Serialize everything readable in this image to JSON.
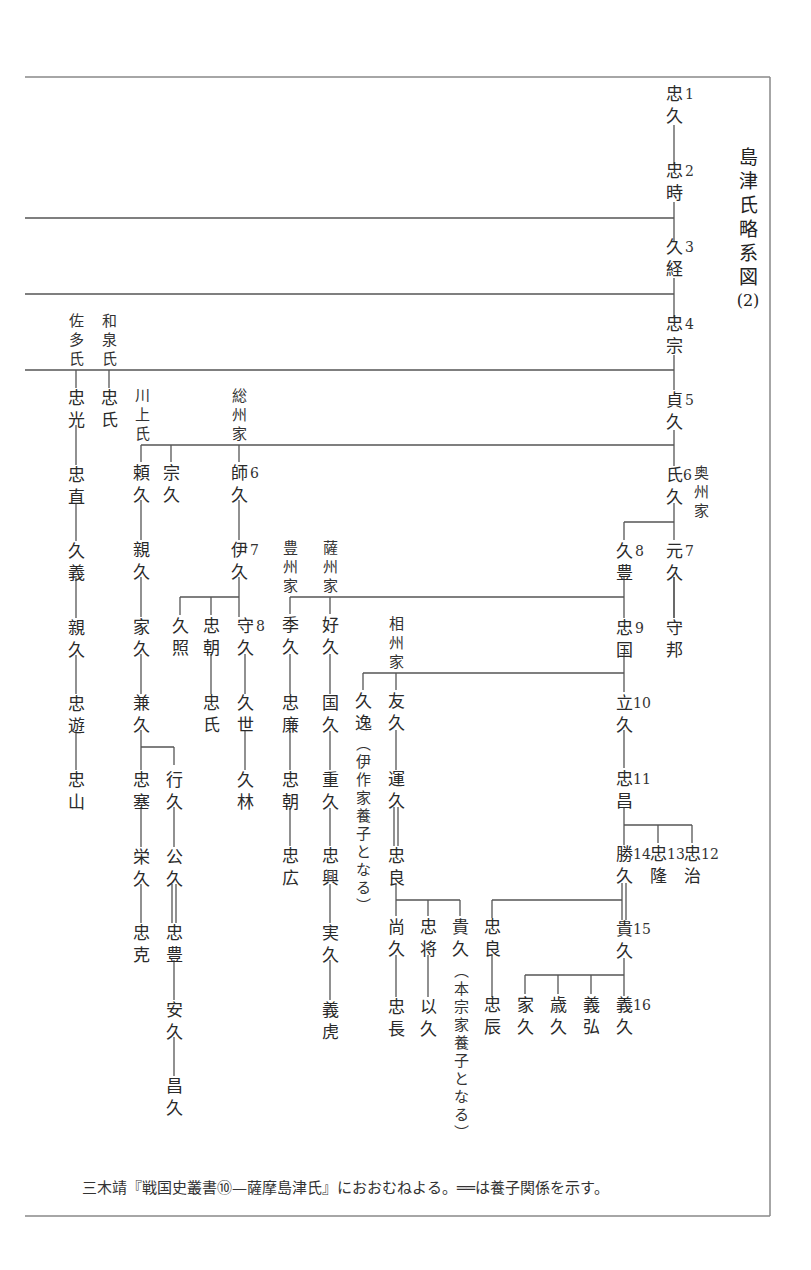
{
  "title_chars": [
    "島",
    "津",
    "氏",
    "略",
    "系",
    "図",
    "(2)"
  ],
  "caption": "三木靖『戦国史叢書⑩—薩摩島津氏』におおむねよる。══は養子関係を示す。",
  "branch_labels": {
    "sata": "佐多氏",
    "izumi": "和泉氏",
    "kawakami": "川上氏",
    "soshu": "総州家",
    "oshu": "奥州家",
    "hoshu": "豊州家",
    "sasshu": "薩州家",
    "soshu_sagami": "相州家"
  },
  "notes": {
    "hisayasu": "（伊作家養子となる）",
    "takahisa": "（本宗家養子となる）"
  },
  "main_line": [
    {
      "name": "忠久",
      "num": "1"
    },
    {
      "name": "忠時",
      "num": "2"
    },
    {
      "name": "久経",
      "num": "3"
    },
    {
      "name": "忠宗",
      "num": "4"
    },
    {
      "name": "貞久",
      "num": "5"
    },
    {
      "name": "氏久",
      "num": "6"
    },
    {
      "name": "元久",
      "num": "7"
    },
    {
      "name": "久豊",
      "num": "8"
    },
    {
      "name": "忠国",
      "num": "9"
    },
    {
      "name": "立久",
      "num": "10"
    },
    {
      "name": "忠昌",
      "num": "11"
    },
    {
      "name": "忠治",
      "num": "12"
    },
    {
      "name": "忠隆",
      "num": "13"
    },
    {
      "name": "勝久",
      "num": "14"
    },
    {
      "name": "貴久",
      "num": "15"
    },
    {
      "name": "義久",
      "num": "16"
    }
  ],
  "sata_line": [
    "忠光",
    "忠直",
    "久義",
    "親久",
    "忠遊",
    "忠山"
  ],
  "izumi_line": [
    "忠氏"
  ],
  "kawakami_line": [
    "頼久",
    "親久",
    "家久",
    "兼久",
    "忠塞",
    "栄久",
    "忠克"
  ],
  "kawakami_branch": [
    "行久",
    "公久",
    "忠豊",
    "安久",
    "昌久"
  ],
  "muneshisa": "宗久",
  "soshu_line": [
    {
      "name": "師久",
      "num": "6"
    },
    {
      "name": "伊久",
      "num": "7"
    },
    {
      "name": "守久",
      "num": "8"
    },
    {
      "name": "久世"
    },
    {
      "name": "久林"
    }
  ],
  "soshu_others": [
    "久照",
    "忠朝",
    "忠氏"
  ],
  "hoshu_line": [
    "季久",
    "忠廉",
    "忠朝",
    "忠広"
  ],
  "sasshu_line": [
    "好久",
    "国久",
    "重久",
    "忠興",
    "実久",
    "義虎"
  ],
  "sagami": {
    "hisayasu": "久逸",
    "tomohisa": "友久",
    "unkyu": "運久",
    "tadayoshi": "忠良",
    "children": [
      "尚久",
      "忠将",
      "貴久"
    ],
    "grandchildren": [
      "忠長",
      "以久"
    ]
  },
  "oshu_extra": [
    "守邦"
  ],
  "katsuhisa_branch": [
    "忠良",
    "忠辰"
  ],
  "yoshihisa_siblings": [
    "家久",
    "歳久",
    "義弘"
  ],
  "chart_data": {
    "type": "tree",
    "root": "忠久",
    "adoption_marker": "══",
    "source": "三木靖『戦国史叢書⑩—薩摩島津氏』"
  }
}
